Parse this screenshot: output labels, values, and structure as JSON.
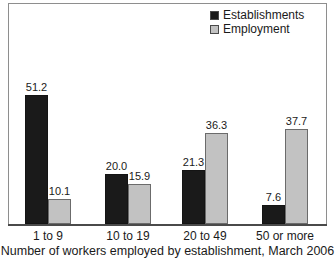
{
  "chart_data": {
    "type": "bar",
    "title": "",
    "subtitle": "",
    "xlabel": "Number of workers employed by establishment, March 2006",
    "ylabel": "",
    "ylim": [
      0,
      51.2
    ],
    "grid": false,
    "legend_position": "top-right",
    "categories": [
      "1 to 9",
      "10 to 19",
      "20 to 49",
      "50 or more"
    ],
    "series": [
      {
        "name": "Establishments",
        "color": "#1a1a1a",
        "values": [
          51.2,
          20.0,
          21.3,
          7.6
        ],
        "labels": [
          "51.2",
          "20.0",
          "21.3",
          "7.6"
        ]
      },
      {
        "name": "Employment",
        "color": "#c2c2c2",
        "values": [
          10.1,
          15.9,
          36.3,
          37.7
        ],
        "labels": [
          "10.1",
          "15.9",
          "36.3",
          "37.7"
        ]
      }
    ]
  },
  "legend": {
    "items": [
      {
        "label": "Establishments",
        "swatch": "legend-swatch-establishments"
      },
      {
        "label": "Employment",
        "swatch": "legend-swatch-employment"
      }
    ]
  },
  "axis": {
    "caption": "Number of workers employed by establishment, March 2006",
    "tick_labels": [
      "1 to 9",
      "10 to 19",
      "20 to 49",
      "50 or more"
    ]
  }
}
